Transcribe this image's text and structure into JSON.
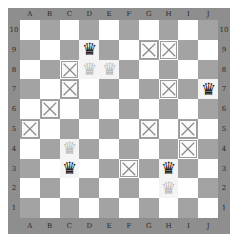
{
  "game": "Game of the Amazons",
  "board": {
    "size": 10,
    "columns": [
      "A",
      "B",
      "C",
      "D",
      "E",
      "F",
      "G",
      "H",
      "I",
      "J"
    ],
    "rows": [
      "10",
      "9",
      "8",
      "7",
      "6",
      "5",
      "4",
      "3",
      "2",
      "1"
    ],
    "colors": {
      "light": "#ffffff",
      "dark": "#a3a3a3",
      "frame": "#8e8e8e"
    }
  },
  "pieces": [
    {
      "square": "D9",
      "color": "black",
      "type": "amazon-queen",
      "glyph": "♛"
    },
    {
      "square": "J7",
      "color": "black",
      "type": "amazon-queen",
      "glyph": "♛"
    },
    {
      "square": "C3",
      "color": "black",
      "type": "amazon-queen",
      "glyph": "♛"
    },
    {
      "square": "H3",
      "color": "black",
      "type": "amazon-queen",
      "glyph": "♛"
    },
    {
      "square": "D8",
      "color": "white",
      "type": "amazon-queen",
      "glyph": "♛"
    },
    {
      "square": "E8",
      "color": "white",
      "type": "amazon-queen",
      "glyph": "♛"
    },
    {
      "square": "C4",
      "color": "white",
      "type": "amazon-queen",
      "glyph": "♛"
    },
    {
      "square": "H2",
      "color": "white",
      "type": "amazon-queen",
      "glyph": "♛"
    }
  ],
  "blocked_squares": [
    "G9",
    "H9",
    "C8",
    "C7",
    "H7",
    "B6",
    "A5",
    "G5",
    "I5",
    "I4",
    "F3"
  ]
}
